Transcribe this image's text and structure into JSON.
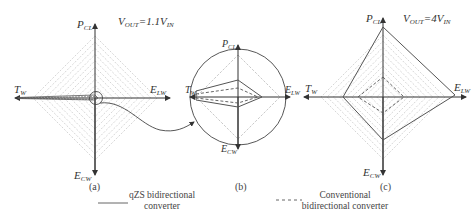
{
  "panels": [
    {
      "id": "a",
      "caption": "(a)",
      "condition": {
        "main": "V",
        "sub": "OUT",
        "eq": "=1.1V",
        "sub2": "IN"
      },
      "axes": {
        "top": {
          "main": "P",
          "sub": "CL"
        },
        "bottom": {
          "main": "E",
          "sub": "CW"
        },
        "left": {
          "main": "T",
          "sub": "W"
        },
        "right": {
          "main": "E",
          "sub": "LW"
        }
      }
    },
    {
      "id": "b",
      "caption": "(b)",
      "note": "zoomed view of circled region in (a)",
      "axes": {
        "top": {
          "main": "P",
          "sub": "CL"
        },
        "bottom": {
          "main": "E",
          "sub": "CW"
        },
        "left": {
          "main": "T",
          "sub": "W"
        },
        "right": {
          "main": "E",
          "sub": "LW"
        }
      }
    },
    {
      "id": "c",
      "caption": "(c)",
      "condition": {
        "main": "V",
        "sub": "OUT",
        "eq": "=4V",
        "sub2": "IN"
      },
      "axes": {
        "top": {
          "main": "P",
          "sub": "CL"
        },
        "bottom": {
          "main": "E",
          "sub": "CW"
        },
        "left": {
          "main": "T",
          "sub": "W"
        },
        "right": {
          "main": "E",
          "sub": "LW"
        }
      }
    }
  ],
  "legend": [
    {
      "style": "solid",
      "line1": "qZS bidirectional",
      "line2": "converter"
    },
    {
      "style": "dashed",
      "line1": "Conventional",
      "line2": "bidirectional converter"
    }
  ],
  "colors": {
    "axis": "#333333",
    "grid": "#b8b8b8",
    "solid": "#555555",
    "dashed": "#555555"
  }
}
